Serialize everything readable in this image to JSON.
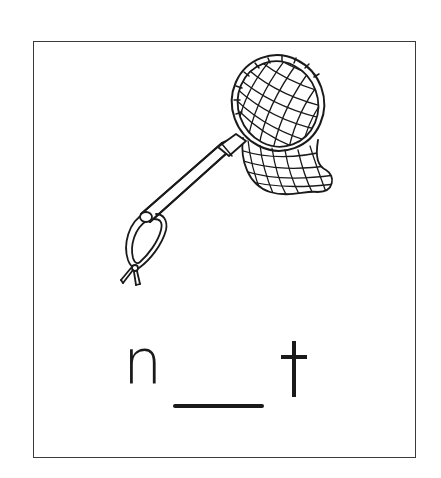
{
  "card": {
    "border_color": "#3a3a3a",
    "background": "#ffffff"
  },
  "illustration": {
    "subject": "butterfly-net",
    "stroke_color": "#1a1a1a"
  },
  "word": {
    "first_letter": "n",
    "blank": "__",
    "last_letter": "t",
    "full_prompt": "n__t",
    "answer_hidden": true
  }
}
